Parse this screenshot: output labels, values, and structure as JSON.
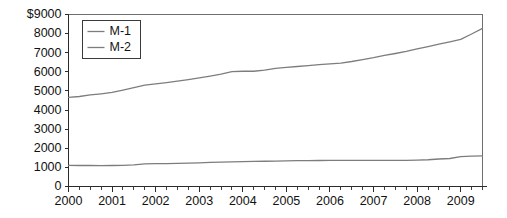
{
  "chart_data": {
    "type": "line",
    "title": "",
    "xlabel": "",
    "ylabel": "",
    "ylim": [
      0,
      9000
    ],
    "xlim": [
      2000.0,
      2009.5
    ],
    "grid": false,
    "legend_position": "top-left",
    "y_ticks": [
      0,
      1000,
      2000,
      3000,
      4000,
      5000,
      6000,
      7000,
      8000,
      9000
    ],
    "y_tick_labels": [
      "0",
      "1000",
      "2000",
      "3000",
      "4000",
      "5000",
      "6000",
      "7000",
      "8000",
      "$9000"
    ],
    "x_ticks": [
      2000,
      2001,
      2002,
      2003,
      2004,
      2005,
      2006,
      2007,
      2008,
      2009
    ],
    "x_tick_labels": [
      "2000",
      "2001",
      "2002",
      "2003",
      "2004",
      "2005",
      "2006",
      "2007",
      "2008",
      "2009"
    ],
    "x_minor_ticks_per_interval": 4,
    "series_color": "#7d7d7d",
    "x": [
      2000.0,
      2000.25,
      2000.5,
      2000.75,
      2001.0,
      2001.25,
      2001.5,
      2001.75,
      2002.0,
      2002.25,
      2002.5,
      2002.75,
      2003.0,
      2003.25,
      2003.5,
      2003.75,
      2004.0,
      2004.25,
      2004.5,
      2004.75,
      2005.0,
      2005.25,
      2005.5,
      2005.75,
      2006.0,
      2006.25,
      2006.5,
      2006.75,
      2007.0,
      2007.25,
      2007.5,
      2007.75,
      2008.0,
      2008.25,
      2008.5,
      2008.75,
      2009.0,
      2009.25,
      2009.5
    ],
    "series": [
      {
        "name": "M-1",
        "values": [
          1110,
          1100,
          1100,
          1095,
          1100,
          1110,
          1130,
          1180,
          1195,
          1200,
          1210,
          1225,
          1240,
          1260,
          1275,
          1290,
          1300,
          1310,
          1320,
          1330,
          1340,
          1350,
          1355,
          1360,
          1365,
          1370,
          1370,
          1368,
          1370,
          1370,
          1368,
          1370,
          1380,
          1400,
          1440,
          1465,
          1560,
          1590,
          1605
        ]
      },
      {
        "name": "M-2",
        "values": [
          4660,
          4710,
          4790,
          4850,
          4920,
          5040,
          5170,
          5300,
          5370,
          5440,
          5510,
          5590,
          5680,
          5780,
          5880,
          6010,
          6030,
          6030,
          6090,
          6180,
          6230,
          6280,
          6330,
          6380,
          6420,
          6460,
          6540,
          6640,
          6740,
          6860,
          6960,
          7070,
          7200,
          7320,
          7450,
          7570,
          7700,
          7980,
          8270
        ]
      }
    ]
  },
  "legend": {
    "entries": [
      {
        "label": "M-1"
      },
      {
        "label": "M-2"
      }
    ]
  }
}
